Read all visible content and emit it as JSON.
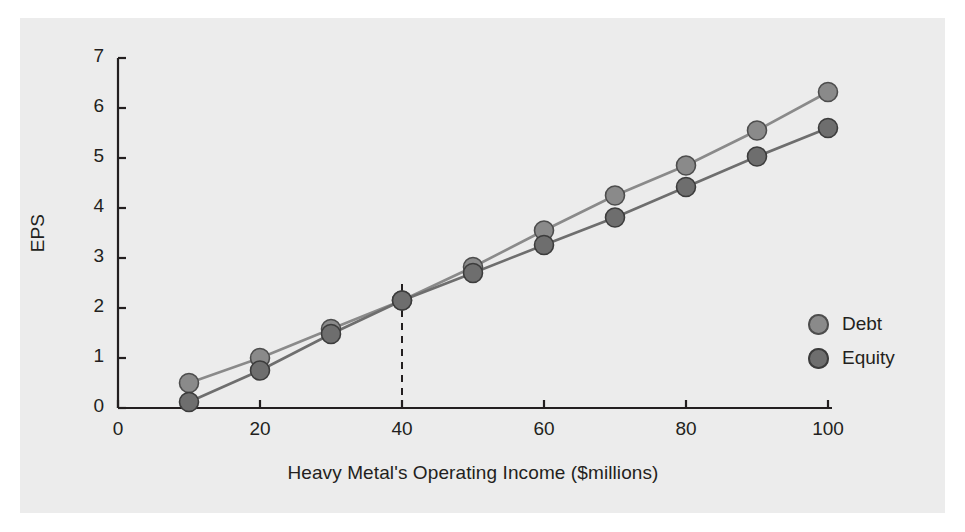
{
  "figure": {
    "background_color": "#ececec",
    "page_color": "#ffffff",
    "axis_color": "#231f20",
    "text_color": "#231f20"
  },
  "axes": {
    "ylabel": "EPS",
    "xlabel": "Heavy Metal's Operating Income ($millions)",
    "xticks": [
      "0",
      "20",
      "40",
      "60",
      "80",
      "100"
    ],
    "yticks": [
      "0",
      "1",
      "2",
      "3",
      "4",
      "5",
      "6",
      "7"
    ]
  },
  "legend": {
    "items": [
      {
        "label": "Debt",
        "color": "#8a8a8a",
        "edge": "#4d4d4d"
      },
      {
        "label": "Equity",
        "color": "#6e6e6e",
        "edge": "#3c3c3c"
      }
    ]
  },
  "annotations": {
    "breakeven_line_label": "indifference-point-dashed-line",
    "breakeven_x": 40,
    "breakeven_eps": 2.15
  },
  "chart_data": {
    "type": "line",
    "title": "",
    "xlabel": "Heavy Metal's Operating Income ($millions)",
    "ylabel": "EPS",
    "xlim": [
      0,
      100
    ],
    "ylim": [
      0,
      7
    ],
    "grid": false,
    "legend_position": "right",
    "x": [
      10,
      20,
      30,
      40,
      50,
      60,
      70,
      80,
      90,
      100
    ],
    "series": [
      {
        "name": "Debt",
        "color": "#8a8a8a",
        "marker": "circle",
        "values": [
          0.5,
          1.0,
          1.58,
          2.15,
          2.82,
          3.55,
          4.25,
          4.85,
          5.55,
          6.32
        ]
      },
      {
        "name": "Equity",
        "color": "#6e6e6e",
        "marker": "circle",
        "values": [
          0.12,
          0.75,
          1.48,
          2.15,
          2.7,
          3.26,
          3.81,
          4.42,
          5.03,
          5.6
        ]
      }
    ],
    "annotations": [
      {
        "type": "vline",
        "x": 40,
        "y_top": 2.6,
        "style": "dashed",
        "color": "#231f20"
      }
    ]
  }
}
